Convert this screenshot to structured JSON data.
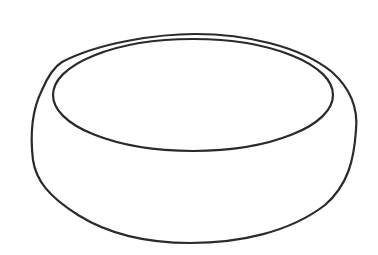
{
  "image": {
    "subject": "bowl",
    "style": "line-drawing",
    "background": "#ffffff",
    "stroke_color": "#2a2a2a",
    "stroke_width": 2.2
  }
}
